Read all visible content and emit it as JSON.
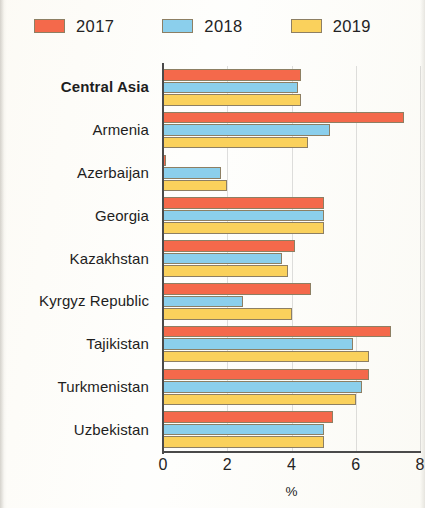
{
  "chart_data": {
    "type": "bar",
    "orientation": "horizontal",
    "title": "",
    "subtitle": "",
    "xlabel": "%",
    "ylabel": "",
    "xlim": [
      0,
      8
    ],
    "xticks": [
      0,
      2,
      4,
      6,
      8
    ],
    "xtick_labels": [
      "0",
      "2",
      "4",
      "6",
      "8"
    ],
    "grid": true,
    "grid_axis": "x",
    "legend_position": "top-left",
    "categories": [
      "Central Asia",
      "Armenia",
      "Azerbaijan",
      "Georgia",
      "Kazakhstan",
      "Kyrgyz Republic",
      "Tajikistan",
      "Turkmenistan",
      "Uzbekistan"
    ],
    "bold_categories": [
      "Central Asia"
    ],
    "series": [
      {
        "name": "2017",
        "color": "#F4694B",
        "values": [
          4.3,
          7.5,
          0.1,
          5.0,
          4.1,
          4.6,
          7.1,
          6.4,
          5.3
        ]
      },
      {
        "name": "2018",
        "color": "#8BCFEC",
        "values": [
          4.2,
          5.2,
          1.8,
          5.0,
          3.7,
          2.5,
          5.9,
          6.2,
          5.0
        ]
      },
      {
        "name": "2019",
        "color": "#FAD15C",
        "values": [
          4.3,
          4.5,
          2.0,
          5.0,
          3.9,
          4.0,
          6.4,
          6.0,
          5.0
        ]
      }
    ]
  },
  "legend": {
    "items": [
      {
        "label": "2017",
        "color": "#F4694B"
      },
      {
        "label": "2018",
        "color": "#8BCFEC"
      },
      {
        "label": "2019",
        "color": "#FAD15C"
      }
    ]
  },
  "axis": {
    "x_title": "%"
  }
}
